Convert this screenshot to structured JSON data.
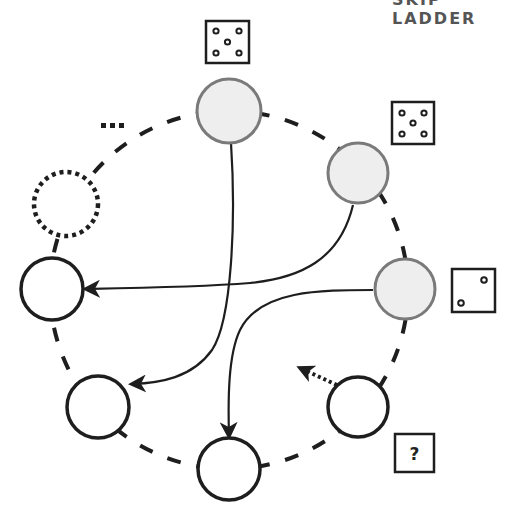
{
  "header": {
    "cut_text": "SKIP LADDER"
  },
  "colors": {
    "stroke": "#1e1e1e",
    "active_fill": "#eeeeee",
    "active_stroke": "#7a7a7a",
    "background": "#ffffff"
  },
  "nodes": [
    {
      "id": "n-top",
      "cx": 229,
      "cy": 111,
      "state": "active",
      "die": "five"
    },
    {
      "id": "n-upper-right",
      "cx": 358,
      "cy": 173,
      "state": "active",
      "die": "five"
    },
    {
      "id": "n-right",
      "cx": 405,
      "cy": 289,
      "state": "active",
      "die": "two"
    },
    {
      "id": "n-lower-right",
      "cx": 358,
      "cy": 407,
      "state": "current",
      "die": "unknown"
    },
    {
      "id": "n-bottom",
      "cx": 229,
      "cy": 469,
      "state": "empty"
    },
    {
      "id": "n-lower-left",
      "cx": 98,
      "cy": 407,
      "state": "empty"
    },
    {
      "id": "n-left",
      "cx": 52,
      "cy": 289,
      "state": "empty"
    },
    {
      "id": "n-placeholder",
      "cx": 66,
      "cy": 204,
      "state": "dotted"
    }
  ],
  "dice": [
    {
      "label": "die-five-top",
      "value": 5
    },
    {
      "label": "die-five-right",
      "value": 5
    },
    {
      "label": "die-two",
      "value": 2
    },
    {
      "label": "die-unknown",
      "value": "?"
    }
  ],
  "ellipsis": "...",
  "arrows": [
    {
      "from": "n-top",
      "to": "n-lower-left",
      "style": "solid"
    },
    {
      "from": "n-upper-right",
      "to": "n-left",
      "style": "solid"
    },
    {
      "from": "n-right",
      "to": "n-bottom",
      "style": "solid"
    },
    {
      "from": "n-lower-right",
      "to": "backward",
      "style": "dotted"
    }
  ],
  "unknown_label": "?"
}
